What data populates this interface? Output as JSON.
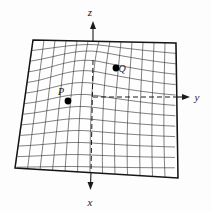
{
  "figure": {
    "background_color": "#fdfdfd",
    "mesh_color": "#2b2b2b",
    "outline_color": "#151515",
    "axis_color": "#1a1a1a",
    "point_color": "#000000"
  },
  "axes": [
    {
      "id": "z",
      "label": "z",
      "direction": "up",
      "label_x": 90,
      "label_y": 16
    },
    {
      "id": "y",
      "label": "y",
      "direction": "right",
      "label_x": 197,
      "label_y": 101
    },
    {
      "id": "x",
      "label": "x",
      "direction": "down",
      "label_x": 90,
      "label_y": 206
    }
  ],
  "points": [
    {
      "id": "P",
      "label": "P",
      "cx": 68,
      "cy": 101,
      "r": 3.4,
      "label_x": 61,
      "label_y": 95
    },
    {
      "id": "Q",
      "label": "Q",
      "cx": 116,
      "cy": 68,
      "r": 3.4,
      "label_x": 122,
      "label_y": 71
    }
  ],
  "surface": {
    "kind": "hill",
    "grid_rows": 13,
    "grid_cols": 13,
    "corners": {
      "top_left": [
        33,
        40
      ],
      "top_right": [
        176,
        43
      ],
      "bottom_right": [
        178,
        178
      ],
      "bottom_left": [
        15,
        168
      ]
    }
  }
}
